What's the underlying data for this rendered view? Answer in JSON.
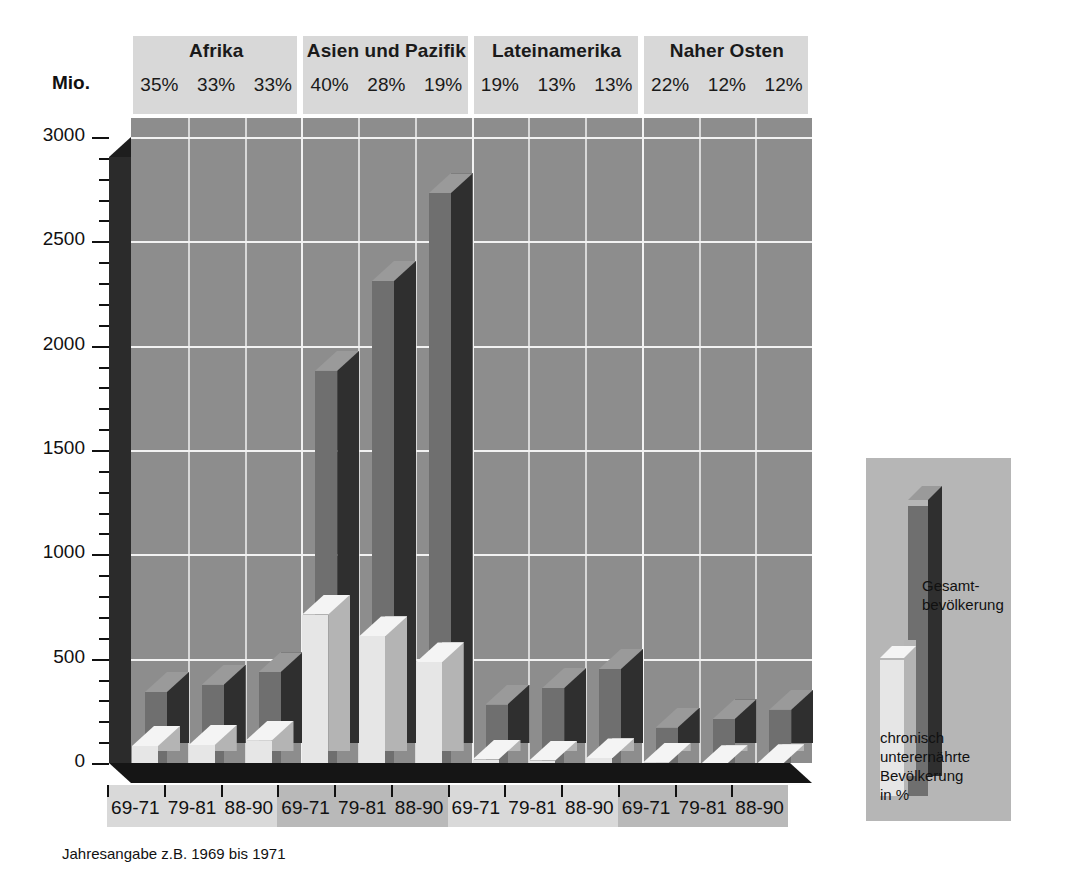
{
  "axis": {
    "unit_label": "Mio.",
    "y_ticks": [
      0,
      500,
      1000,
      1500,
      2000,
      2500,
      3000
    ],
    "y_min": 0,
    "y_max": 3000,
    "minor_step": 100
  },
  "footnote": "Jahresangabe z.B. 1969 bis 1971",
  "legend": {
    "total_label": "Gesamt-\nbevölkerung",
    "undernourished_label": "chronisch\nunterernährte\nBevölkerung\nin %"
  },
  "colors": {
    "plot_background": "#8d8d8d",
    "gridline": "#f2f2f2",
    "bar_total_face": "#6f6f6f",
    "bar_total_side": "#2f2f2f",
    "bar_total_top": "#9a9a9a",
    "bar_under_face": "#e6e6e6",
    "bar_under_side": "#b4b4b4",
    "bar_under_top": "#f4f4f4",
    "axis_wall": "#2b2b2b",
    "floor": "#151515",
    "header_band": "#d8d8d8",
    "xstrip": "#d9d9d9",
    "xstrip_alt": "#b9b9b9",
    "legend_background": "#b6b6b6"
  },
  "chart_data": {
    "type": "bar",
    "title": "",
    "subtitle": "",
    "xlabel": "",
    "ylabel": "Mio.",
    "ylim": [
      0,
      3000
    ],
    "grid": true,
    "legend_position": "right",
    "categories": [
      "69-71",
      "79-81",
      "88-90",
      "69-71",
      "79-81",
      "88-90",
      "69-71",
      "79-81",
      "88-90",
      "69-71",
      "79-81",
      "88-90"
    ],
    "groups": [
      {
        "name": "Afrika",
        "periods": [
          "69-71",
          "79-81",
          "88-90"
        ],
        "percent_labels": [
          "35%",
          "33%",
          "33%"
        ],
        "percent_values": [
          35,
          33,
          33
        ],
        "total_population": [
          340,
          375,
          435
        ],
        "undernourished": [
          120,
          125,
          145
        ]
      },
      {
        "name": "Asien und Pazifik",
        "periods": [
          "69-71",
          "79-81",
          "88-90"
        ],
        "percent_labels": [
          "40%",
          "28%",
          "19%"
        ],
        "percent_values": [
          40,
          28,
          19
        ],
        "total_population": [
          1880,
          2310,
          2730
        ],
        "undernourished": [
          750,
          645,
          520
        ]
      },
      {
        "name": "Lateinamerika",
        "periods": [
          "69-71",
          "79-81",
          "88-90"
        ],
        "percent_labels": [
          "19%",
          "13%",
          "13%"
        ],
        "percent_values": [
          19,
          13,
          13
        ],
        "total_population": [
          280,
          360,
          450
        ],
        "undernourished": [
          55,
          50,
          60
        ]
      },
      {
        "name": "Naher Osten",
        "periods": [
          "69-71",
          "79-81",
          "88-90"
        ],
        "percent_labels": [
          "22%",
          "12%",
          "12%"
        ],
        "percent_values": [
          22,
          12,
          12
        ],
        "total_population": [
          170,
          210,
          255
        ],
        "undernourished": [
          40,
          28,
          32
        ]
      }
    ],
    "series": [
      {
        "name": "Gesamtbevölkerung",
        "values": [
          340,
          375,
          435,
          1880,
          2310,
          2730,
          280,
          360,
          450,
          170,
          210,
          255
        ]
      },
      {
        "name": "chronisch unterernährte Bevölkerung",
        "values": [
          120,
          125,
          145,
          750,
          645,
          520,
          55,
          50,
          60,
          40,
          28,
          32
        ]
      }
    ]
  }
}
